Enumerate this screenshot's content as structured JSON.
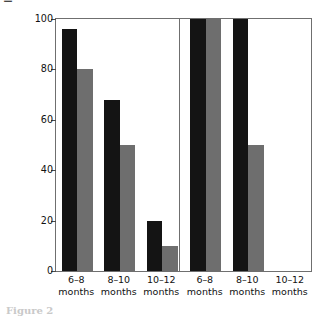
{
  "chart_data": {
    "type": "bar",
    "title": "",
    "subtitle": "",
    "xlabel": "",
    "ylabel": "Infants able to discriminate (%)",
    "ylim": [
      0,
      100
    ],
    "yticks": [
      0,
      20,
      40,
      60,
      80,
      100
    ],
    "ytick_labels": [
      "0",
      "20",
      "40",
      "60",
      "80",
      "100"
    ],
    "grid": false,
    "legend": "none",
    "panels": [
      {
        "name": "left-panel",
        "categories": [
          "6–8 months",
          "8–10 months",
          "10–12 months"
        ],
        "series": [
          {
            "name": "series-black",
            "color": "#141414",
            "values": [
              96,
              68,
              20
            ]
          },
          {
            "name": "series-grey",
            "color": "#6e6e6e",
            "values": [
              80,
              50,
              10
            ]
          }
        ]
      },
      {
        "name": "right-panel",
        "categories": [
          "6–8 months",
          "8–10 months",
          "10–12 months"
        ],
        "series": [
          {
            "name": "series-black",
            "color": "#141414",
            "values": [
              100,
              100,
              0
            ]
          },
          {
            "name": "series-grey",
            "color": "#6e6e6e",
            "values": [
              100,
              50,
              0
            ]
          }
        ]
      }
    ],
    "category_lines": [
      {
        "l1": "6–8",
        "l2": "months"
      },
      {
        "l1": "8–10",
        "l2": "months"
      },
      {
        "l1": "10–12",
        "l2": "months"
      },
      {
        "l1": "6–8",
        "l2": "months"
      },
      {
        "l1": "8–10",
        "l2": "months"
      },
      {
        "l1": "10–12",
        "l2": "months"
      }
    ]
  },
  "axes": {
    "y_title": "Infants able to discriminate (%)",
    "frame_color": "#6f6f6f",
    "tick_color": "#4a4a4a"
  },
  "caption": {
    "text": "Figure 2"
  }
}
